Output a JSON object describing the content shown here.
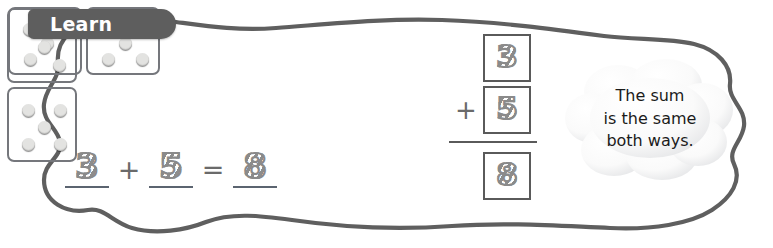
{
  "section": {
    "tab_label": "Learn"
  },
  "horizontal_model": {
    "domino": {
      "name": "domino-3-and-5-horizontal",
      "left_pips": 3,
      "right_pips": 5
    },
    "equation": {
      "addend1": "3",
      "operator": "+",
      "addend2": "5",
      "equals": "=",
      "sum": "8"
    }
  },
  "vertical_model": {
    "domino": {
      "name": "domino-3-and-5-vertical",
      "top_pips": 3,
      "bottom_pips": 5
    },
    "equation": {
      "addend1": "3",
      "operator": "+",
      "addend2": "5",
      "sum": "8"
    }
  },
  "callout": {
    "line1": "The sum",
    "line2": "is the same",
    "line3": "both ways."
  },
  "colors": {
    "tab_background": "#5e5e5e",
    "tab_text": "#ffffff",
    "domino_body": "#63656a",
    "domino_pip": "#e3e3e1",
    "outline": "#5a5a5a",
    "trace_number": "#8d8d8d",
    "page_background": "#ffffff"
  }
}
